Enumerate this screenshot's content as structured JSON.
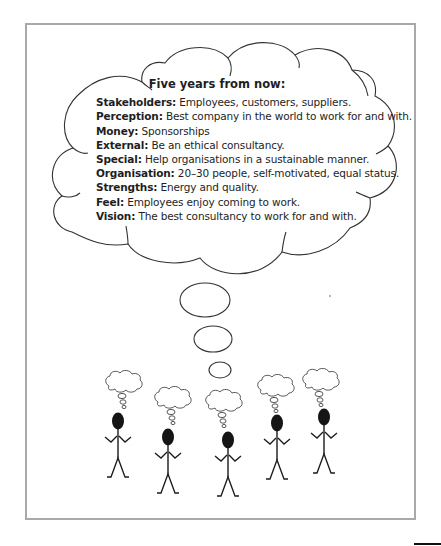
{
  "figure": {
    "cloud_title": "Five years from now:",
    "items": [
      {
        "key": "Stakeholders:",
        "value": " Employees, customers, suppliers."
      },
      {
        "key": "Perception:",
        "value": " Best company in the world to work for and with."
      },
      {
        "key": "Money:",
        "value": " Sponsorships"
      },
      {
        "key": "External:",
        "value": " Be an ethical consultancy."
      },
      {
        "key": "Special:",
        "value": " Help organisations in a sustainable manner."
      },
      {
        "key": "Organisation:",
        "value": " 20–30 people, self-motivated, equal status."
      },
      {
        "key": "Strengths:",
        "value": " Energy and quality."
      },
      {
        "key": "Feel:",
        "value": " Employees enjoy coming to work."
      },
      {
        "key": "Vision:",
        "value": " The best consultancy to work for and with."
      }
    ],
    "people_count": 5,
    "colors": {
      "frame": "#a9a9a9",
      "ink": "#1e1e1e",
      "head": "#111111"
    }
  }
}
